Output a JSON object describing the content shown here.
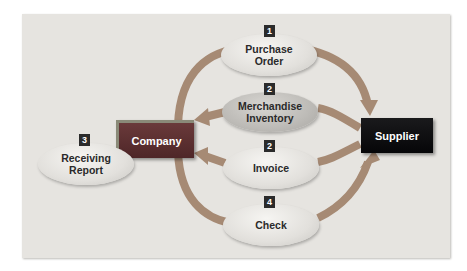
{
  "diagram": {
    "nodes": {
      "company": {
        "label": "Company"
      },
      "supplier": {
        "label": "Supplier"
      }
    },
    "documents": [
      {
        "step": "1",
        "line1": "Purchase",
        "line2": "Order"
      },
      {
        "step": "2",
        "line1": "Merchandise",
        "line2": "Inventory"
      },
      {
        "step": "3",
        "line1": "Receiving",
        "line2": "Report"
      },
      {
        "step": "2",
        "line1": "Invoice",
        "line2": ""
      },
      {
        "step": "4",
        "line1": "Check",
        "line2": ""
      }
    ],
    "flows": [
      {
        "from": "Company",
        "to": "Supplier",
        "document": "Purchase Order",
        "step": "1"
      },
      {
        "from": "Supplier",
        "to": "Company",
        "document": "Merchandise Inventory",
        "step": "2"
      },
      {
        "from": "Supplier",
        "to": "Company",
        "document": "Invoice",
        "step": "2"
      },
      {
        "from": "Company",
        "to": "Supplier",
        "document": "Check",
        "step": "4"
      }
    ],
    "colors": {
      "panel": "#e6e4e0",
      "arrow": "#a0816a",
      "company": "#5a2e30",
      "supplier": "#0b0b0d",
      "badge": "#2b2b2b"
    }
  }
}
